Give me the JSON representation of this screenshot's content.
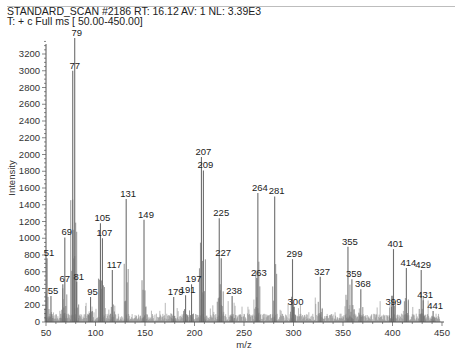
{
  "header": {
    "line1": "STANDARD_SCAN #2186   RT: 16.12   AV: 1   NL: 3.39E3",
    "line2": "T: + c Full ms [ 50.00-450.00]"
  },
  "chart_data": {
    "type": "bar",
    "title": "STANDARD_SCAN #2186  RT: 16.12  AV: 1  NL: 3.39E3",
    "subtitle": "T: + c Full ms [ 50.00-450.00]",
    "xlabel": "m/z",
    "ylabel": "Intensity",
    "xlim": [
      50,
      450
    ],
    "ylim": [
      0,
      3390
    ],
    "xticks": [
      50,
      100,
      150,
      200,
      250,
      300,
      350,
      400,
      450
    ],
    "yticks": [
      0,
      200,
      400,
      600,
      800,
      1000,
      1200,
      1400,
      1600,
      1800,
      2000,
      2200,
      2400,
      2600,
      2800,
      3000,
      3200
    ],
    "grid": false,
    "legend": null,
    "labeled_peaks": [
      {
        "mz": 51,
        "intensity": 760
      },
      {
        "mz": 55,
        "intensity": 310
      },
      {
        "mz": 67,
        "intensity": 450
      },
      {
        "mz": 69,
        "intensity": 1010
      },
      {
        "mz": 77,
        "intensity": 3000
      },
      {
        "mz": 79,
        "intensity": 3390
      },
      {
        "mz": 81,
        "intensity": 480
      },
      {
        "mz": 95,
        "intensity": 300
      },
      {
        "mz": 105,
        "intensity": 1180
      },
      {
        "mz": 107,
        "intensity": 1000
      },
      {
        "mz": 117,
        "intensity": 620
      },
      {
        "mz": 131,
        "intensity": 1470
      },
      {
        "mz": 149,
        "intensity": 1220
      },
      {
        "mz": 179,
        "intensity": 300
      },
      {
        "mz": 191,
        "intensity": 320
      },
      {
        "mz": 197,
        "intensity": 450
      },
      {
        "mz": 207,
        "intensity": 1970
      },
      {
        "mz": 209,
        "intensity": 1810
      },
      {
        "mz": 225,
        "intensity": 1240
      },
      {
        "mz": 227,
        "intensity": 760
      },
      {
        "mz": 238,
        "intensity": 310
      },
      {
        "mz": 263,
        "intensity": 525
      },
      {
        "mz": 264,
        "intensity": 1540
      },
      {
        "mz": 281,
        "intensity": 1500
      },
      {
        "mz": 299,
        "intensity": 750
      },
      {
        "mz": 300,
        "intensity": 180
      },
      {
        "mz": 327,
        "intensity": 540
      },
      {
        "mz": 355,
        "intensity": 900
      },
      {
        "mz": 359,
        "intensity": 510
      },
      {
        "mz": 368,
        "intensity": 390
      },
      {
        "mz": 399,
        "intensity": 180
      },
      {
        "mz": 401,
        "intensity": 870
      },
      {
        "mz": 414,
        "intensity": 645
      },
      {
        "mz": 429,
        "intensity": 620
      },
      {
        "mz": 431,
        "intensity": 260
      },
      {
        "mz": 441,
        "intensity": 130
      }
    ]
  },
  "colors": {
    "peak": "#6e6e6e",
    "axis": "#555555",
    "text": "#222222"
  }
}
